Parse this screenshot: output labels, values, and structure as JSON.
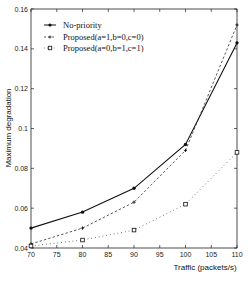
{
  "chart_data": {
    "type": "line",
    "title": "",
    "xlabel": "Traffic (packets/s)",
    "ylabel": "Maximum degradation",
    "xlim": [
      70,
      110
    ],
    "ylim": [
      0.04,
      0.16
    ],
    "x_ticks": [
      70,
      75,
      80,
      85,
      90,
      95,
      100,
      105,
      110
    ],
    "x_tick_labels": [
      "70",
      "75",
      "80",
      "85",
      "90",
      "95",
      "100",
      "105",
      "110"
    ],
    "y_ticks": [
      0.04,
      0.06,
      0.08,
      0.1,
      0.12,
      0.14,
      0.16
    ],
    "y_tick_labels": [
      "0.04",
      "0.06",
      "0.08",
      "0.1",
      "0.12",
      "0.14",
      "0.16"
    ],
    "grid": false,
    "legend_position": "upper left",
    "x": [
      70,
      80,
      90,
      100,
      110
    ],
    "series": [
      {
        "name": "No-priority",
        "style": "solid",
        "marker": "filled-dot",
        "values": [
          0.05,
          0.058,
          0.07,
          0.092,
          0.143
        ]
      },
      {
        "name": "Proposed(a=1,b=0,c=0)",
        "style": "dashed",
        "marker": "plus",
        "values": [
          0.042,
          0.05,
          0.063,
          0.089,
          0.152
        ]
      },
      {
        "name": "Proposed(a=0,b=1,c=1)",
        "style": "dotted",
        "marker": "square",
        "values": [
          0.041,
          0.044,
          0.049,
          0.062,
          0.088
        ]
      }
    ]
  },
  "legend": {
    "items": [
      "No-priority",
      "Proposed(a=1,b=0,c=0)",
      "Proposed(a=0,b=1,c=1)"
    ]
  }
}
